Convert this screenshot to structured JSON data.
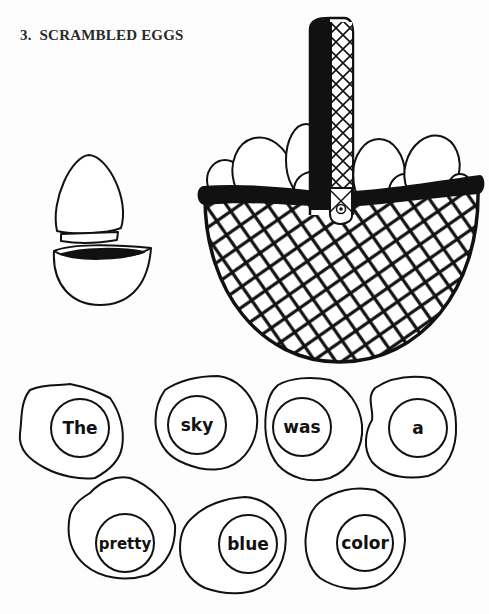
{
  "section": {
    "number": "3.",
    "title": "SCRAMBLED EGGS"
  },
  "illustrations": {
    "cracked_egg": "cracked-egg-icon",
    "basket": "egg-basket-icon"
  },
  "word_eggs": [
    {
      "word": "The"
    },
    {
      "word": "sky"
    },
    {
      "word": "was"
    },
    {
      "word": "a"
    },
    {
      "word": "pretty"
    },
    {
      "word": "blue"
    },
    {
      "word": "color"
    }
  ],
  "sentence": "The sky was a pretty blue color",
  "colors": {
    "ink": "#111111",
    "paper": "#fdfdfd"
  }
}
